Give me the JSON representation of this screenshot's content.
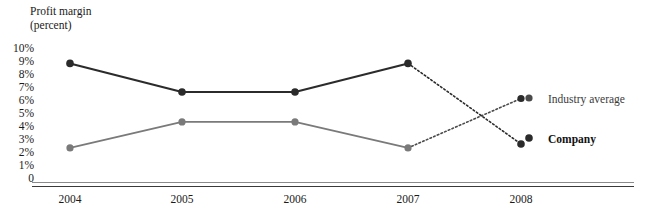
{
  "chart_data": {
    "type": "line",
    "title": "",
    "ylabel": "Profit margin\n(percent)",
    "xlabel": "",
    "categories": [
      "2004",
      "2005",
      "2006",
      "2007",
      "2008"
    ],
    "ylim": [
      0,
      10
    ],
    "ytick_labels": [
      "10%",
      "9%",
      "8%",
      "7%",
      "6%",
      "5%",
      "4%",
      "3%",
      "2%",
      "1%",
      "0"
    ],
    "ytick_values": [
      10,
      9,
      8,
      7,
      6,
      5,
      4,
      3,
      2,
      1,
      0
    ],
    "grid": false,
    "legend_position": "right",
    "series": [
      {
        "name": "Company",
        "color": "#2b2b2b",
        "values": [
          8.7,
          6.5,
          6.5,
          8.7,
          2.5
        ],
        "solid_through_index": 3,
        "projected_style": "dotted"
      },
      {
        "name": "Industry average",
        "color": "#7a7a7a",
        "values": [
          2.2,
          4.2,
          4.2,
          2.2,
          6.0
        ],
        "solid_through_index": 3,
        "projected_style": "dotted"
      }
    ],
    "annotations": []
  },
  "axis": {
    "y_title": "Profit margin\n(percent)",
    "y_ticks": [
      "10%",
      "9%",
      "8%",
      "7%",
      "6%",
      "5%",
      "4%",
      "3%",
      "2%",
      "1%",
      "0"
    ],
    "x_ticks": [
      "2004",
      "2005",
      "2006",
      "2007",
      "2008"
    ]
  },
  "legend": {
    "industry_label": "Industry average",
    "company_label": "Company"
  },
  "colors": {
    "company_line": "#2b2b2b",
    "industry_line": "#7a7a7a",
    "rule": "#3a3a3a",
    "text": "#1a1a1a"
  }
}
